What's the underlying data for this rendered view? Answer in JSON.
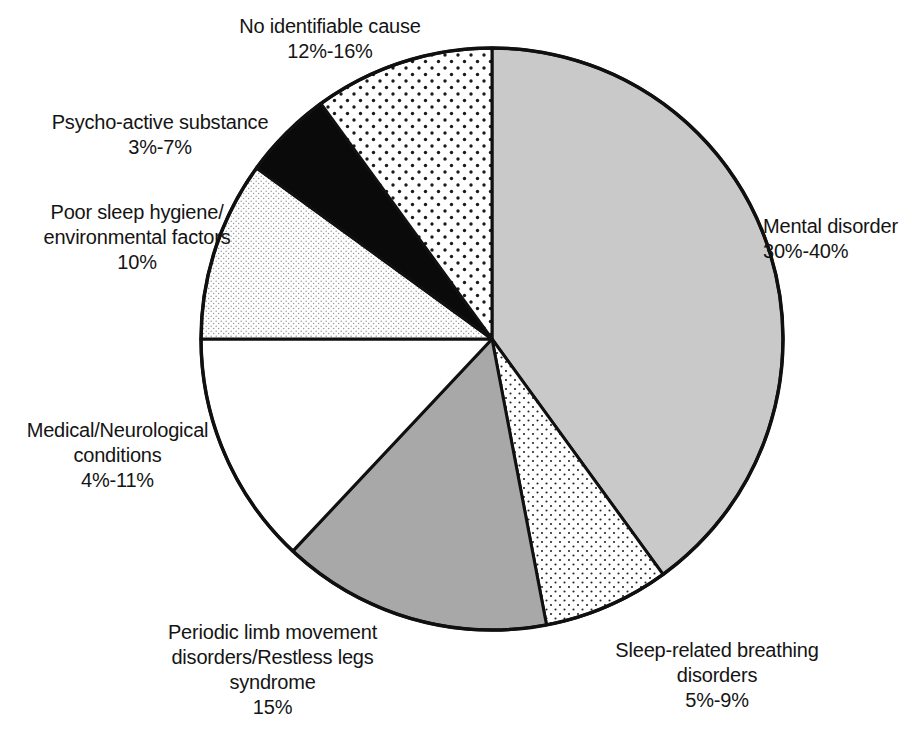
{
  "chart_data": {
    "type": "pie",
    "title": "",
    "subtitle": "",
    "xlabel": "",
    "ylabel": "",
    "legend_position": "none",
    "grid": false,
    "center": {
      "x": 492,
      "y": 339
    },
    "radius": 291,
    "start_angle_deg": 0,
    "direction": "clockwise",
    "slices": [
      {
        "name": "Mental disorder",
        "label_line1": "Mental disorder",
        "label_line2": "30%-40%",
        "range_text": "30%-40%",
        "value": 35,
        "range_low": 30,
        "range_high": 40,
        "start_deg": 0,
        "end_deg": 144,
        "fill": "#c9c9c9",
        "pattern": "solid-light-gray"
      },
      {
        "name": "Sleep-related breathing disorders",
        "label_line1": "Sleep-related breathing",
        "label_line2": "disorders",
        "label_line3": "5%-9%",
        "range_text": "5%-9%",
        "value": 7,
        "range_low": 5,
        "range_high": 9,
        "start_deg": 144,
        "end_deg": 169.2,
        "fill": "#ffffff",
        "pattern": "fine-dots"
      },
      {
        "name": "Periodic limb movement disorders/Restless legs syndrome",
        "label_line1": "Periodic limb movement",
        "label_line2": "disorders/Restless legs",
        "label_line3": "syndrome",
        "label_line4": "15%",
        "range_text": "15%",
        "value": 15,
        "range_low": 15,
        "range_high": 15,
        "start_deg": 169.2,
        "end_deg": 223.2,
        "fill": "#a8a8a8",
        "pattern": "solid-medium-gray"
      },
      {
        "name": "Medical/Neurological conditions",
        "label_line1": "Medical/Neurological",
        "label_line2": "conditions",
        "label_line3": "4%-11%",
        "range_text": "4%-11%",
        "value": 7.5,
        "range_low": 4,
        "range_high": 11,
        "start_deg": 223.2,
        "end_deg": 270,
        "fill": "#ffffff",
        "pattern": "plain-white"
      },
      {
        "name": "Poor sleep hygiene/environmental factors",
        "label_line1": "Poor sleep hygiene/",
        "label_line2": "environmental factors",
        "label_line3": "10%",
        "range_text": "10%",
        "value": 10,
        "range_low": 10,
        "range_high": 10,
        "start_deg": 270,
        "end_deg": 306,
        "fill": "#ffffff",
        "pattern": "light-stipple"
      },
      {
        "name": "Psycho-active substance",
        "label_line1": "Psycho-active substance",
        "label_line2": "3%-7%",
        "range_text": "3%-7%",
        "value": 5,
        "range_low": 3,
        "range_high": 7,
        "start_deg": 306,
        "end_deg": 324,
        "fill": "#0a0a0a",
        "pattern": "solid-black"
      },
      {
        "name": "No identifiable cause",
        "label_line1": "No identifiable cause",
        "label_line2": "12%-16%",
        "range_text": "12%-16%",
        "value": 14,
        "range_low": 12,
        "range_high": 16,
        "start_deg": 324,
        "end_deg": 360,
        "fill": "#ffffff",
        "pattern": "bold-dots"
      }
    ]
  },
  "labels": {
    "no_cause": "No identifiable cause\n12%-16%",
    "psychoactive": "Psycho-active substance\n3%-7%",
    "hygiene": "Poor sleep hygiene/\nenvironmental factors\n10%",
    "medical": "Medical/Neurological\nconditions\n4%-11%",
    "plm": "Periodic limb movement\ndisorders/Restless legs\nsyndrome\n15%",
    "breathing": "Sleep-related breathing\ndisorders\n5%-9%",
    "mental": "Mental disorder\n30%-40%"
  },
  "colors": {
    "outline": "#101010",
    "light_gray": "#c9c9c9",
    "medium_gray": "#a8a8a8",
    "black": "#0a0a0a",
    "white": "#ffffff",
    "background": "#ffffff"
  }
}
